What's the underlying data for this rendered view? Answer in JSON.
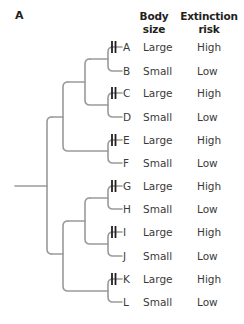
{
  "panel": {
    "label": "A"
  },
  "headers": {
    "body_size": {
      "line1": "Body",
      "line2": "size"
    },
    "extinction_risk": {
      "line1": "Extinction",
      "line2": "risk"
    }
  },
  "colors": {
    "branch": "#9a9a9a",
    "marker": "#231f20",
    "text": "#3a3a3a"
  },
  "rows": [
    {
      "taxon": "A",
      "body_size": "Large",
      "extinction_risk": "High",
      "marker": true
    },
    {
      "taxon": "B",
      "body_size": "Small",
      "extinction_risk": "Low",
      "marker": false
    },
    {
      "taxon": "C",
      "body_size": "Large",
      "extinction_risk": "High",
      "marker": true
    },
    {
      "taxon": "D",
      "body_size": "Small",
      "extinction_risk": "Low",
      "marker": false
    },
    {
      "taxon": "E",
      "body_size": "Large",
      "extinction_risk": "High",
      "marker": true
    },
    {
      "taxon": "F",
      "body_size": "Small",
      "extinction_risk": "Low",
      "marker": false
    },
    {
      "taxon": "G",
      "body_size": "Large",
      "extinction_risk": "High",
      "marker": true
    },
    {
      "taxon": "H",
      "body_size": "Small",
      "extinction_risk": "Low",
      "marker": false
    },
    {
      "taxon": "I",
      "body_size": "Large",
      "extinction_risk": "High",
      "marker": true
    },
    {
      "taxon": "J",
      "body_size": "Small",
      "extinction_risk": "Low",
      "marker": false
    },
    {
      "taxon": "K",
      "body_size": "Large",
      "extinction_risk": "High",
      "marker": true
    },
    {
      "taxon": "L",
      "body_size": "Small",
      "extinction_risk": "Low",
      "marker": false
    }
  ],
  "tree": {
    "topology": "((((A,B),(C,D)),(E,F)),(((G,H),(I,J)),(K,L)))",
    "marker_meaning": "double bar marks transition on branches leading to large-bodied taxa"
  }
}
